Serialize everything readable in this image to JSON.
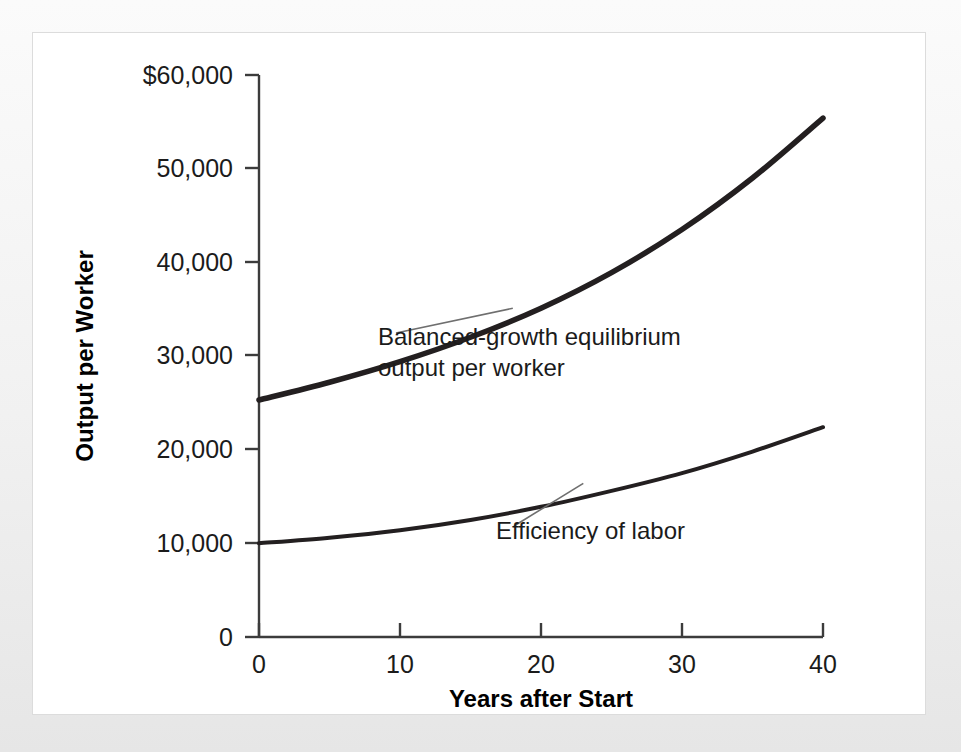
{
  "figure": {
    "background_color": "#f1f1f1",
    "card_color": "#ffffff",
    "ink_color": "#231f20"
  },
  "chart_data": {
    "type": "line",
    "title": "",
    "subtitle": "",
    "xlabel": "Years after Start",
    "ylabel": "Output per Worker",
    "xlim": [
      0,
      40
    ],
    "ylim": [
      0,
      60000
    ],
    "grid": false,
    "legend_position": "inline-annotations",
    "x_ticks": [
      0,
      10,
      20,
      30,
      40
    ],
    "x_tick_labels": [
      "0",
      "10",
      "20",
      "30",
      "40"
    ],
    "y_ticks": [
      0,
      10000,
      20000,
      30000,
      40000,
      50000,
      60000
    ],
    "y_tick_labels": [
      "0",
      "10,000",
      "20,000",
      "30,000",
      "40,000",
      "50,000",
      "$60,000"
    ],
    "x": [
      0,
      5,
      10,
      15,
      20,
      25,
      30,
      35,
      40
    ],
    "series": [
      {
        "name": "Balanced-growth equilibrium output per worker",
        "values": [
          25300,
          27200,
          29400,
          32000,
          35100,
          38900,
          43500,
          49000,
          55400
        ]
      },
      {
        "name": "Efficiency of labor",
        "values": [
          10000,
          10600,
          11400,
          12500,
          13900,
          15600,
          17500,
          19800,
          22400
        ]
      }
    ],
    "annotations": [
      {
        "name": "balanced-growth-annotation",
        "line1": "Balanced-growth equilibrium",
        "line2": "output per worker",
        "anchor_x": 18,
        "anchor_y": 35100
      },
      {
        "name": "efficiency-of-labor-annotation",
        "line1": "Efficiency of labor",
        "line2": "",
        "anchor_x": 23,
        "anchor_y": 16400
      }
    ]
  }
}
